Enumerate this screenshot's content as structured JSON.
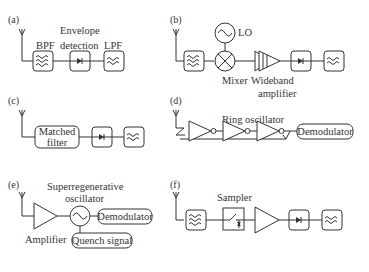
{
  "panels": {
    "a": {
      "label": "(a)",
      "bpf": "BPF",
      "env1": "Envelope",
      "env2": "detection",
      "lpf": "LPF"
    },
    "b": {
      "label": "(b)",
      "lo": "LO",
      "mixer": "Mixer",
      "amp1": "Wideband",
      "amp2": "amplifier"
    },
    "c": {
      "label": "(c)",
      "mf1": "Matched",
      "mf2": "filter"
    },
    "d": {
      "label": "(d)",
      "ring": "Ring oscillator",
      "demod": "Demodulator"
    },
    "e": {
      "label": "(e)",
      "sro1": "Superregenerative",
      "sro2": "oscillator",
      "demod": "Demodulator",
      "amp": "Amplifier",
      "quench": "Quench signal"
    },
    "f": {
      "label": "(f)",
      "sampler": "Sampler"
    }
  },
  "colors": {
    "stroke": "#333333",
    "background": "#ffffff"
  }
}
